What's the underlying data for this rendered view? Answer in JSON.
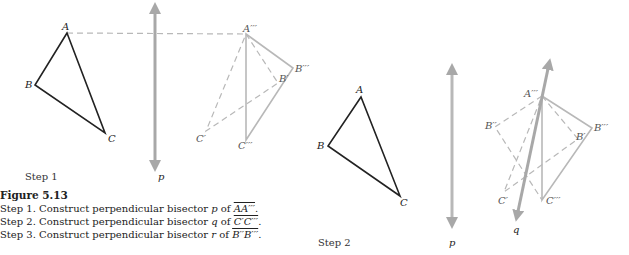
{
  "figure": {
    "title": "Figure 5.13",
    "caption_lines": [
      {
        "prefix": "Step 1.  Construct perpendicular bisector ",
        "line": "p",
        "mid": " of ",
        "segment": "AA′′′",
        "suffix": "."
      },
      {
        "prefix": "Step 2.  Construct perpendicular bisector ",
        "line": "q",
        "mid": " of ",
        "segment": "C′C′′′",
        "suffix": "."
      },
      {
        "prefix": "Step 3.  Construct perpendicular bisector ",
        "line": "r",
        "mid": " of ",
        "segment": "B′′B′′′",
        "suffix": "."
      }
    ]
  },
  "panels": [
    {
      "step_label": "Step 1",
      "line_label": "p",
      "points": {
        "A": "A",
        "B": "B",
        "C": "C",
        "A3": "A′′′",
        "B3": "B′′′",
        "C3": "C′′′",
        "B1": "B′",
        "C1": "C′"
      }
    },
    {
      "step_label": "Step 2",
      "line_label_p": "p",
      "line_label_q": "q",
      "points": {
        "A": "A",
        "B": "B",
        "C": "C",
        "A3": "A′′′",
        "B3": "B′′′",
        "C3": "C′′′",
        "B1": "B′",
        "C1": "C′",
        "B2": "B′′"
      }
    }
  ],
  "colors": {
    "original_triangle": "#222222",
    "construction": "#b8b8b8",
    "bisector": "#a8a8a8"
  }
}
